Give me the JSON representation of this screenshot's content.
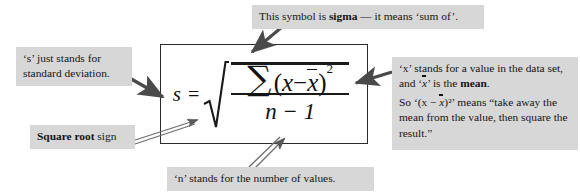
{
  "figure": {
    "kind": "annotated-formula-diagram",
    "title_text": "Standard deviation formula with annotations",
    "colors": {
      "note_background": "#d7d7d7",
      "text": "#141414",
      "rule": "#2b2b2b",
      "arrow": "#4a4a4a",
      "page_background": "#ffffff"
    }
  },
  "formula": {
    "plain": "s = sqrt( SUM (x - xbar)^2 / (n - 1) )",
    "lhs_symbol": "s",
    "equals": "=",
    "sigma_symbol": "∑",
    "numerator_open_paren": "(",
    "numerator_var": "x",
    "numerator_minus": "−",
    "numerator_mean": "x",
    "numerator_close_paren": ")",
    "numerator_exponent": "2",
    "denominator": "n − 1"
  },
  "notes": {
    "sigma": {
      "label": "sigma-note",
      "lead": "This symbol is ",
      "bold": "sigma",
      "tail": " — it means ‘sum of’."
    },
    "s_symbol": {
      "label": "s-note",
      "text": "‘s’ just stands for standard deviation."
    },
    "square_root": {
      "label": "square-root-note",
      "bold": "Square root",
      "tail": " sign"
    },
    "x_and_mean": {
      "label": "x-note",
      "line1_a": "‘x’ stands for a value in the data set, and ‘",
      "line1_mean": "x",
      "line1_b": "’ is the ",
      "line1_bold": "mean",
      "line1_end": ".",
      "line2_a": "So ‘(x − ",
      "line2_mean": "x",
      "line2_b": ")²’ means “take away the mean from the value, then square the result.”"
    },
    "n_symbol": {
      "label": "n-note",
      "text": "‘n’ stands for the number of values."
    }
  },
  "arrows": [
    {
      "name": "arrow-sigma-to-summation",
      "from": "sigma-note",
      "to": "sigma-symbol",
      "style": "solid-filled"
    },
    {
      "name": "arrow-s-to-s-symbol",
      "from": "s-note",
      "to": "s-symbol",
      "style": "solid-filled"
    },
    {
      "name": "arrow-sqrt-to-radical",
      "from": "square-root-note",
      "to": "radical-sign",
      "style": "outline-double"
    },
    {
      "name": "arrow-x-to-numerator",
      "from": "x-note",
      "to": "numerator-group",
      "style": "solid-filled"
    },
    {
      "name": "arrow-n-to-denominator",
      "from": "n-note",
      "to": "denominator",
      "style": "outline-double"
    }
  ]
}
